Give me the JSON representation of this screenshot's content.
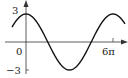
{
  "chart_data": {
    "type": "line",
    "title": "",
    "function": "y = 3 cos(x/3)",
    "xlabel": "",
    "ylabel": "",
    "x_tick_labels": [
      "0",
      "6π"
    ],
    "y_tick_labels": [
      "3",
      "−3"
    ],
    "ylim": [
      -3,
      3
    ],
    "xlim_pi_units": [
      -1,
      6.5
    ],
    "amplitude": 3,
    "period": "6π",
    "grid": false,
    "legend": null,
    "series": [
      {
        "name": "3cos(x/3)",
        "x_pi_units": [
          -1,
          0,
          1.5,
          3,
          4.5,
          6,
          6.5
        ],
        "y": [
          2.6,
          3,
          0,
          -3,
          0,
          3,
          2.9
        ]
      }
    ]
  },
  "labels": {
    "origin": "0",
    "x_max": "6π",
    "y_max": "3",
    "y_min": "−3"
  }
}
